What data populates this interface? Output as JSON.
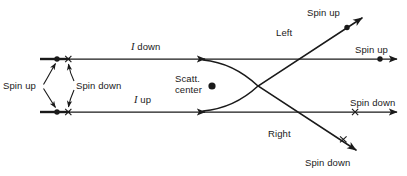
{
  "figure": {
    "stroke_color": "#1a1a1a",
    "background_color": "#ffffff",
    "labels": {
      "spin_up_left": "Spin up",
      "spin_down_left": "Spin down",
      "beam_top": "I down",
      "beam_bottom": "I up",
      "scatt_line1": "Scatt.",
      "scatt_line2": "center",
      "left": "Left",
      "right": "Right",
      "spin_up_diagonal": "Spin up",
      "spin_up_horizontal": "Spin up",
      "spin_down_horizontal": "Spin down",
      "spin_down_diagonal": "Spin down"
    },
    "markers": {
      "dot_meaning": "Spin up",
      "cross_meaning": "Spin down",
      "scattering_center": "Scatt. center"
    }
  }
}
